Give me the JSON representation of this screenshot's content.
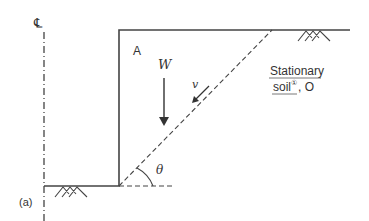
{
  "figure": {
    "panel_label": "(a)",
    "centerline_symbol": "℄",
    "block_label": "A",
    "weight_label": "W",
    "velocity_label": "v",
    "angle_label": "θ",
    "soil_label_line1": "Stationary",
    "soil_label_line2": "soil",
    "soil_superscript": "①",
    "soil_label_suffix": ", O"
  },
  "colors": {
    "line": "#444444",
    "text": "#333333"
  }
}
